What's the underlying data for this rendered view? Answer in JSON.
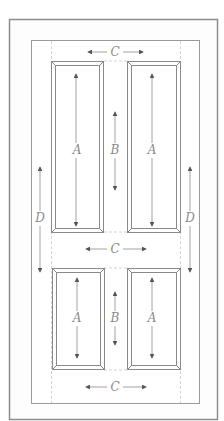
{
  "diagram": {
    "type": "four-panel door elevation",
    "labels": {
      "panel_height": "A",
      "mid_rail_gap": "B",
      "rail_width": "C",
      "stile_span": "D"
    },
    "annotations": [
      {
        "id": "c-top",
        "text": "C"
      },
      {
        "id": "a-top-left",
        "text": "A"
      },
      {
        "id": "a-top-right",
        "text": "A"
      },
      {
        "id": "b-top",
        "text": "B"
      },
      {
        "id": "d-left",
        "text": "D"
      },
      {
        "id": "d-right",
        "text": "D"
      },
      {
        "id": "c-mid",
        "text": "C"
      },
      {
        "id": "a-bottom-left",
        "text": "A"
      },
      {
        "id": "a-bottom-right",
        "text": "A"
      },
      {
        "id": "b-bottom",
        "text": "B"
      },
      {
        "id": "c-bottom",
        "text": "C"
      }
    ],
    "colors": {
      "outer_frame": "#8c8c8c",
      "inner_frame": "#9a9a9a",
      "panel_line": "#8a8a8a",
      "dashed": "#c4c4c4",
      "arrow": "#555555",
      "label": "#8a8a8a"
    }
  }
}
